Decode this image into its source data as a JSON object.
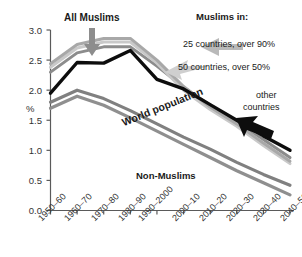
{
  "chart_data": {
    "type": "line",
    "title": "",
    "xlabel": "",
    "ylabel": "%",
    "ylim": [
      0.0,
      3.0
    ],
    "grid": false,
    "legend_position": "in-plot-annotations",
    "categories": [
      "1950–60",
      "1960–70",
      "1970–80",
      "1980–90",
      "1990–2000",
      "2000–10",
      "2010–20",
      "2020–30",
      "2030–40",
      "2040–50"
    ],
    "yticks": [
      "0.0",
      "0.5",
      "1.0",
      "1.5",
      "2.0",
      "2.5",
      "3.0"
    ],
    "ytick_values": [
      0.0,
      0.5,
      1.0,
      1.5,
      2.0,
      2.5,
      3.0
    ],
    "series": [
      {
        "name": "All Muslims",
        "color": "#8c8c8c",
        "width": 3.0,
        "values": [
          2.3,
          2.62,
          2.72,
          2.72,
          2.4,
          2.05,
          1.75,
          1.48,
          1.18,
          0.88
        ]
      },
      {
        "name": "25 countries, over 90%",
        "color": "#c9c9c9",
        "width": 3.0,
        "values": [
          2.38,
          2.7,
          2.8,
          2.8,
          2.45,
          2.0,
          1.68,
          1.4,
          1.08,
          0.78
        ]
      },
      {
        "name": "50 countries, over 50%",
        "color": "#a8a8a8",
        "width": 3.0,
        "values": [
          2.44,
          2.76,
          2.86,
          2.86,
          2.5,
          2.06,
          1.72,
          1.44,
          1.12,
          0.82
        ]
      },
      {
        "name": "other countries",
        "color": "#0d0d0d",
        "width": 3.4,
        "values": [
          1.95,
          2.46,
          2.45,
          2.66,
          2.18,
          2.02,
          1.76,
          1.5,
          1.24,
          1.0
        ]
      },
      {
        "name": "World population",
        "color": "#808080",
        "width": 3.2,
        "values": [
          1.8,
          2.0,
          1.86,
          1.66,
          1.44,
          1.22,
          1.02,
          0.8,
          0.6,
          0.42
        ]
      },
      {
        "name": "Non-Muslims",
        "color": "#8f8f8f",
        "width": 3.2,
        "values": [
          1.7,
          1.9,
          1.75,
          1.54,
          1.32,
          1.1,
          0.88,
          0.66,
          0.46,
          0.26
        ]
      }
    ],
    "annotations": [
      {
        "id": "all-muslims",
        "text": "All Muslims",
        "bold": true
      },
      {
        "id": "muslims-in",
        "text": "Muslims in:",
        "bold": true
      },
      {
        "id": "cat-25",
        "text": "25 countries, over 90%",
        "bold": false
      },
      {
        "id": "cat-50",
        "text": "50 countries, over 50%",
        "bold": false
      },
      {
        "id": "other-countries-1",
        "text": "other",
        "bold": false
      },
      {
        "id": "other-countries-2",
        "text": "countries",
        "bold": false
      },
      {
        "id": "world-population",
        "text": "World population",
        "bold": true
      },
      {
        "id": "non-muslims",
        "text": "Non-Muslims",
        "bold": true
      }
    ]
  },
  "axis": {
    "ylabel": "%",
    "yticks": [
      "3.0",
      "2.5",
      "2.0",
      "1.5",
      "1.0",
      "0.5",
      "0.0"
    ],
    "xticks": [
      "1950–60",
      "1960–70",
      "1970–80",
      "1980–90",
      "1990–2000",
      "2000–10",
      "2010–20",
      "2020–30",
      "2030–40",
      "2040–50"
    ]
  },
  "labels": {
    "all_muslims": "All Muslims",
    "muslims_in": "Muslims in:",
    "cat_25": "25 countries, over 90%",
    "cat_50": "50 countries, over 50%",
    "other_1": "other",
    "other_2": "countries",
    "world_population": "World population",
    "non_muslims": "Non-Muslims"
  },
  "colors": {
    "axis": "#5a5a5a",
    "text": "#1a1a1a",
    "black_line": "#0d0d0d",
    "arrow_gray": "#999999",
    "arrow_black": "#0d0d0d",
    "background": "#ffffff"
  }
}
